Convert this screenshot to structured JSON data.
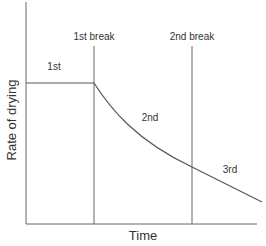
{
  "diagram": {
    "type": "drying-rate-curve",
    "axes": {
      "y_label": "Rate of drying",
      "x_label": "Time"
    },
    "breaks": [
      {
        "label": "1st break"
      },
      {
        "label": "2nd break"
      }
    ],
    "stages": [
      {
        "label": "1st"
      },
      {
        "label": "2nd"
      },
      {
        "label": "3rd"
      }
    ],
    "colors": {
      "line": "#555555",
      "text": "#333333",
      "background": "#ffffff"
    }
  }
}
